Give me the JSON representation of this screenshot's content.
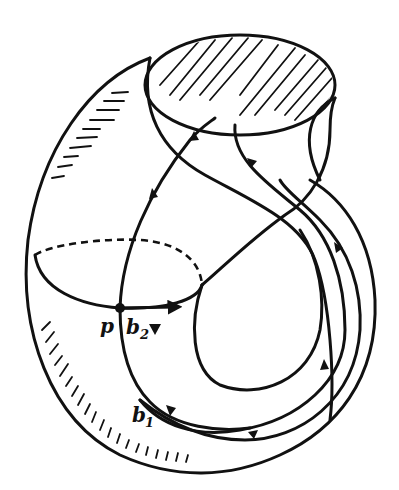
{
  "diagram": {
    "type": "topological surface with curves",
    "colors": {
      "ink": "#111111",
      "background": "#ffffff"
    },
    "labels": {
      "point": "p",
      "curve_b1": "b",
      "curve_b1_sub": "1",
      "curve_b2": "b",
      "curve_b2_sub": "2"
    },
    "elements": [
      "outer-surface-outline",
      "hatched-top-disk",
      "meridian-ellipse-solid-front",
      "meridian-ellipse-dashed-back",
      "curve-b1-loop",
      "curve-b2-loop",
      "base-point-p",
      "direction-arrows"
    ]
  }
}
